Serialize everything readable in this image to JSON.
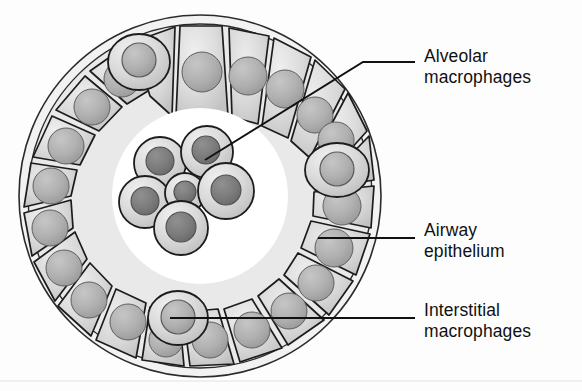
{
  "figure": {
    "type": "biological-diagram"
  },
  "labels": {
    "alveolar": {
      "line1": "Alveolar",
      "line2": "macrophages"
    },
    "airway": {
      "line1": "Airway",
      "line2": "epithelium"
    },
    "interstitial": {
      "line1": "Interstitial",
      "line2": "macrophages"
    }
  },
  "colors": {
    "background": "#fdfdfd",
    "cell_fill_light": "#e6e6e6",
    "cell_fill_mid": "#d2d2d2",
    "cell_fill_dark": "#bdbdbd",
    "nucleus_epithelial": "#b0b0b0",
    "nucleus_macrophage": "#808080",
    "outline": "#1c1c1c",
    "membrane": "#2b2b2b",
    "leader_line": "#111111",
    "text": "#111111",
    "baseline_rule": "#d9d9d9"
  },
  "structure": {
    "lumen_label": "lumen",
    "basement_membrane_label": "basement membrane",
    "epithelial_cell_count": 16,
    "alveolar_macrophage_count": 6,
    "interstitial_macrophage_count": 3
  },
  "geometry": {
    "circle_center_x": 200,
    "circle_center_y": 196,
    "outer_radius": 182,
    "inner_radius": 112
  },
  "leaders": {
    "alveolar": "from cluster at (205,160) to (363,62) then to (415,62)",
    "airway": "from (318,238) to (415,238)",
    "interstitial": "from (178,318) to (415,318)"
  }
}
